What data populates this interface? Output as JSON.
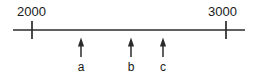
{
  "figure": {
    "background_color": "#ffffff",
    "stroke_color": "#2b2b2b",
    "text_color": "#1a1a1a"
  },
  "axis": {
    "x_start_px": 13,
    "x_end_px": 245,
    "y_px": 30,
    "line_width_px": 1.6
  },
  "ticks": [
    {
      "label": "2000",
      "value": 2000,
      "x_px": 32,
      "label_x_px": 17,
      "label_y_px": 5,
      "top_px": 21,
      "bottom_px": 39
    },
    {
      "label": "3000",
      "value": 3000,
      "x_px": 226,
      "label_x_px": 208,
      "label_y_px": 5,
      "top_px": 21,
      "bottom_px": 39
    }
  ],
  "arrows": [
    {
      "label": "a",
      "x_px": 81,
      "tip_y_px": 38,
      "tail_y_px": 57,
      "label_y_px": 61,
      "approx_value": 2253
    },
    {
      "label": "b",
      "x_px": 131,
      "tip_y_px": 38,
      "tail_y_px": 57,
      "label_y_px": 61,
      "approx_value": 2510
    },
    {
      "label": "c",
      "x_px": 163,
      "tip_y_px": 38,
      "tail_y_px": 57,
      "label_y_px": 61,
      "approx_value": 2675
    }
  ],
  "chart_data": {
    "type": "line",
    "title": "",
    "subtitle": "",
    "xlabel": "",
    "ylabel": "",
    "grid": false,
    "legend": null,
    "xlim": [
      2000,
      3000
    ],
    "tick_labels": [
      "2000",
      "3000"
    ],
    "tick_values": [
      2000,
      3000
    ],
    "annotations": [
      {
        "label": "a",
        "x": 2253
      },
      {
        "label": "b",
        "x": 2510
      },
      {
        "label": "c",
        "x": 2675
      }
    ]
  }
}
